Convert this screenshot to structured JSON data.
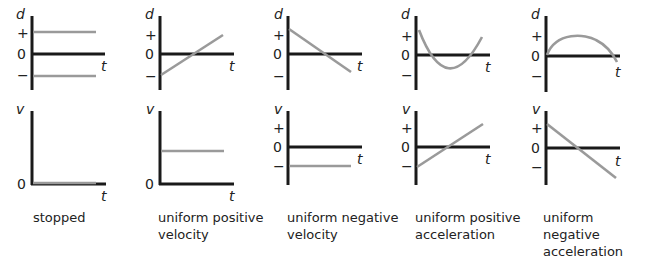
{
  "figure": {
    "axis_labels": {
      "position": "d",
      "velocity": "v",
      "time": "t"
    },
    "tick_labels": {
      "plus": "+",
      "zero": "0",
      "minus": "−"
    },
    "panels": [
      {
        "caption_line1": "stopped",
        "caption_line2": "",
        "d_graph": "two horizontal lines at constant + and − positions",
        "v_graph": "horizontal line at v = 0"
      },
      {
        "caption_line1": "uniform positive",
        "caption_line2": "velocity",
        "d_graph": "straight line rising from − to +",
        "v_graph": "horizontal line at constant positive v"
      },
      {
        "caption_line1": "uniform negative",
        "caption_line2": "velocity",
        "d_graph": "straight line falling from + to −",
        "v_graph": "horizontal line at constant negative v"
      },
      {
        "caption_line1": "uniform positive",
        "caption_line2": "acceleration",
        "d_graph": "upward-opening parabola",
        "v_graph": "straight line rising from − to +"
      },
      {
        "caption_line1": "uniform negative",
        "caption_line2": "acceleration",
        "d_graph": "downward-opening parabola",
        "v_graph": "straight line falling from + to −"
      }
    ]
  },
  "colors": {
    "axis": "#1a1a1a",
    "curve": "#9a9a9a"
  }
}
